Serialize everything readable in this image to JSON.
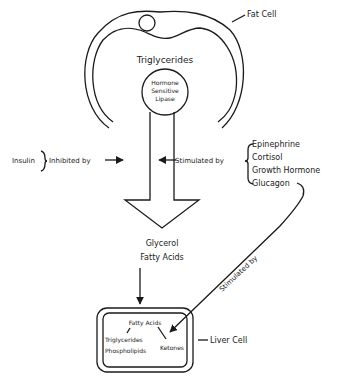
{
  "fat_cell": {
    "label": "Fat Cell",
    "contents": "Triglycerides",
    "enzyme": [
      "Hormone",
      "Sensitive",
      "Lipase"
    ]
  },
  "inhibition": {
    "hormone": "Insulin",
    "label": "Inhibited by"
  },
  "stimulation": {
    "label": "Stimulated by",
    "hormones": [
      "Epinephrine",
      "Cortisol",
      "Growth Hormone",
      "Glucagon"
    ]
  },
  "products": [
    "Glycerol",
    "Fatty Acids"
  ],
  "glucagon_link": {
    "label": "Stimulated by"
  },
  "liver_cell": {
    "label": "Liver Cell",
    "input": "Fatty Acids",
    "outputs_left": [
      "Triglycerides",
      "Phospholipids"
    ],
    "output_right": "Ketones"
  },
  "colors": {
    "ink": "#1a1a1a",
    "background": "#ffffff"
  }
}
